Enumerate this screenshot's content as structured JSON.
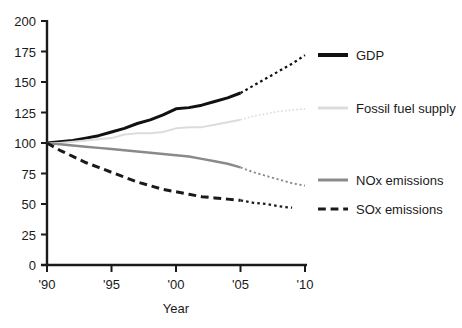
{
  "chart_data": {
    "type": "line",
    "title": "",
    "xlabel": "Year",
    "ylabel": "",
    "xlim": [
      1990,
      2010
    ],
    "ylim": [
      0,
      200
    ],
    "grid": false,
    "legend_position": "right",
    "x_tick_labels": [
      "'90",
      "'95",
      "'00",
      "'05",
      "'10"
    ],
    "x_tick_values": [
      1990,
      1995,
      2000,
      2005,
      2010
    ],
    "y_tick_labels": [
      "0",
      "25",
      "50",
      "75",
      "100",
      "125",
      "150",
      "175",
      "200"
    ],
    "y_tick_values": [
      0,
      25,
      50,
      75,
      100,
      125,
      150,
      175,
      200
    ],
    "note": "All series indexed to 100 in 1990. Solid segments are historical data through 2005; dotted segments are projections to 2010.",
    "series": [
      {
        "name": "GDP",
        "color": "#111111",
        "style": "solid",
        "width": 3,
        "projection_style": "dotted",
        "x": [
          1990,
          1991,
          1992,
          1993,
          1994,
          1995,
          1996,
          1997,
          1998,
          1999,
          2000,
          2001,
          2002,
          2003,
          2004,
          2005,
          2006,
          2007,
          2008,
          2009,
          2010
        ],
        "values": [
          100,
          101,
          102,
          104,
          106,
          109,
          112,
          116,
          119,
          123,
          128,
          129,
          131,
          134,
          137,
          141,
          147,
          153,
          159,
          165,
          172
        ],
        "solid_until": 2005
      },
      {
        "name": "Fossil fuel supply",
        "color": "#dcdcdc",
        "style": "solid",
        "width": 2,
        "projection_style": "dotted",
        "x": [
          1990,
          1991,
          1992,
          1993,
          1994,
          1995,
          1996,
          1997,
          1998,
          1999,
          2000,
          2001,
          2002,
          2003,
          2004,
          2005,
          2006,
          2007,
          2008,
          2009,
          2010
        ],
        "values": [
          100,
          100,
          101,
          102,
          103,
          104,
          107,
          108,
          108,
          109,
          112,
          113,
          113,
          115,
          117,
          119,
          122,
          124,
          126,
          127,
          128
        ],
        "solid_until": 2005
      },
      {
        "name": "NOx emissions",
        "color": "#8a8a8a",
        "style": "solid",
        "width": 2.5,
        "projection_style": "dotted",
        "x": [
          1990,
          1991,
          1992,
          1993,
          1994,
          1995,
          1996,
          1997,
          1998,
          1999,
          2000,
          2001,
          2002,
          2003,
          2004,
          2005,
          2006,
          2007,
          2008,
          2009,
          2010
        ],
        "values": [
          100,
          99,
          98,
          97,
          96,
          95,
          94,
          93,
          92,
          91,
          90,
          89,
          87,
          85,
          83,
          80,
          76,
          73,
          70,
          67,
          65
        ],
        "solid_until": 2005
      },
      {
        "name": "SOx emissions",
        "color": "#1a1a1a",
        "style": "dashed",
        "width": 3,
        "projection_style": "dotted",
        "x": [
          1990,
          1991,
          1992,
          1993,
          1994,
          1995,
          1996,
          1997,
          1998,
          1999,
          2000,
          2001,
          2002,
          2003,
          2004,
          2005,
          2006,
          2007,
          2008,
          2009
        ],
        "values": [
          100,
          94,
          89,
          84,
          80,
          76,
          72,
          68,
          65,
          62,
          60,
          58,
          56,
          55,
          54,
          53,
          51,
          50,
          48,
          47
        ],
        "solid_until": 2005
      }
    ],
    "legend": [
      {
        "label": "GDP",
        "color": "#111111",
        "style": "solid",
        "width": 4
      },
      {
        "label": "Fossil fuel supply",
        "color": "#dcdcdc",
        "style": "solid",
        "width": 3
      },
      {
        "label": "NOx emissions",
        "color": "#8a8a8a",
        "style": "solid",
        "width": 3
      },
      {
        "label": "SOx emissions",
        "color": "#1a1a1a",
        "style": "dashed",
        "width": 3
      }
    ]
  }
}
